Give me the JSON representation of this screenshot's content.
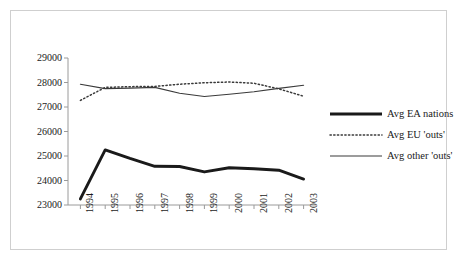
{
  "chart_data": {
    "type": "line",
    "title": "",
    "xlabel": "",
    "ylabel": "",
    "categories": [
      "1994",
      "1995",
      "1996",
      "1997",
      "1998",
      "1999",
      "2000",
      "2001",
      "2002",
      "2003"
    ],
    "ylim": [
      23000,
      29000
    ],
    "ytick_labels": [
      "29000",
      "28000",
      "27000",
      "26000",
      "25000",
      "24000",
      "23000"
    ],
    "ytick_values": [
      29000,
      28000,
      27000,
      26000,
      25000,
      24000,
      23000
    ],
    "grid": false,
    "legend_position": "right",
    "series": [
      {
        "name": "Avg EA nations",
        "style": "thick-solid",
        "color": "#1a1a1a",
        "values": [
          23250,
          25250,
          24900,
          24580,
          24570,
          24350,
          24520,
          24480,
          24420,
          24060
        ]
      },
      {
        "name": "Avg EU 'outs'",
        "style": "dotted",
        "color": "#3a3a3a",
        "values": [
          27270,
          27800,
          27830,
          27840,
          27930,
          27990,
          28020,
          27970,
          27740,
          27440
        ]
      },
      {
        "name": "Avg other 'outs'",
        "style": "thin-solid",
        "color": "#3a3a3a",
        "values": [
          27930,
          27750,
          27770,
          27800,
          27560,
          27430,
          27520,
          27620,
          27760,
          27890
        ]
      }
    ]
  },
  "legend": {
    "items": [
      {
        "label": "Avg EA nations"
      },
      {
        "label": "Avg EU 'outs'"
      },
      {
        "label": "Avg other 'outs'"
      }
    ]
  }
}
